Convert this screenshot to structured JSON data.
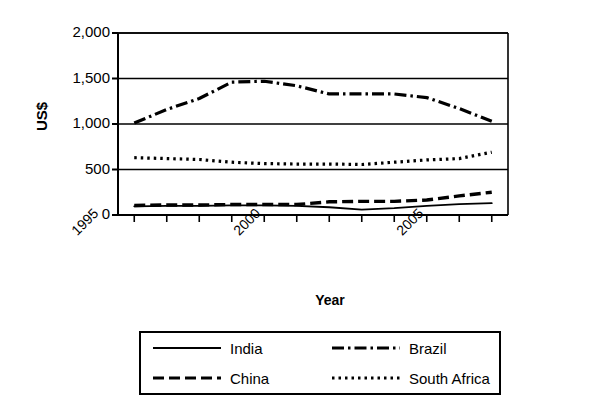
{
  "chart_data": {
    "type": "line",
    "title": "",
    "xlabel": "Year",
    "ylabel": "US$",
    "x": [
      1996,
      1997,
      1998,
      1999,
      2000,
      2001,
      2002,
      2003,
      2004,
      2005,
      2006,
      2007
    ],
    "xlim": [
      1995.5,
      2007.5
    ],
    "ylim": [
      0,
      2000
    ],
    "ytick_labels": [
      "0",
      "500",
      "1,000",
      "1,500",
      "2,000"
    ],
    "ytick_values": [
      0,
      500,
      1000,
      1500,
      2000
    ],
    "xtick_labels": [
      "1995",
      "2000",
      "2005"
    ],
    "xtick_values": [
      1995,
      2000,
      2005
    ],
    "grid": "horizontal",
    "legend_position": "below",
    "series": [
      {
        "name": "India",
        "style": "solid",
        "values": [
          95,
          100,
          100,
          105,
          105,
          100,
          85,
          60,
          75,
          100,
          120,
          130
        ]
      },
      {
        "name": "Brazil",
        "style": "dash-dot",
        "values": [
          1010,
          1160,
          1280,
          1460,
          1470,
          1420,
          1330,
          1330,
          1330,
          1290,
          1170,
          1030
        ]
      },
      {
        "name": "China",
        "style": "dashed",
        "values": [
          105,
          110,
          110,
          115,
          115,
          115,
          145,
          150,
          150,
          165,
          210,
          250
        ]
      },
      {
        "name": "South Africa",
        "style": "dotted",
        "values": [
          630,
          620,
          610,
          580,
          565,
          560,
          560,
          555,
          580,
          605,
          620,
          690
        ]
      }
    ]
  },
  "legend": {
    "entries": [
      {
        "label": "India",
        "style": "solid"
      },
      {
        "label": "Brazil",
        "style": "dash-dot"
      },
      {
        "label": "China",
        "style": "dashed"
      },
      {
        "label": "South Africa",
        "style": "dotted"
      }
    ]
  }
}
